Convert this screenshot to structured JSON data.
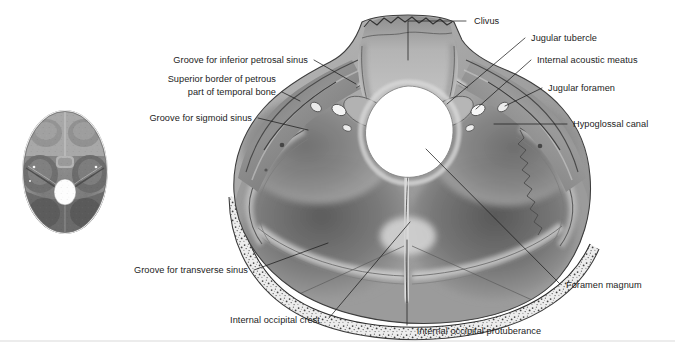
{
  "figure": {
    "background_color": "#ffffff",
    "text_color": "#1c1c1c",
    "leader_color": "#1d1d1d",
    "separator_color": "#d9d9d9"
  },
  "inset": {
    "name": "orientation-inset-skull-base",
    "description": "Small grayscale superior view of the interior of the cranial base showing anterior, middle and posterior cranial fossae with the foramen magnum"
  },
  "main_illustration": {
    "name": "posterior-cranial-fossa",
    "description": "Shaded grayscale drawing of the posterior cranial fossa seen from above, with the clivus anteriorly, the foramen magnum centrally, petrous ridges laterally and the cut diploic bone margin posteriorly"
  },
  "labels": [
    {
      "id": "clivus",
      "text": "Clivus",
      "align": "start",
      "x": 474,
      "y": 24,
      "leader": "M 466 21 L 408 21 L 408 60"
    },
    {
      "id": "jugular-tubercle",
      "text": "Jugular tubercle",
      "align": "start",
      "x": 531,
      "y": 41,
      "leader": "M 525 38 L 447 104"
    },
    {
      "id": "internal-acoustic-meatus",
      "text": "Internal acoustic meatus",
      "align": "start",
      "x": 537,
      "y": 63,
      "leader": "M 531 60 L 476 109"
    },
    {
      "id": "jugular-foramen",
      "text": "Jugular foramen",
      "align": "start",
      "x": 548,
      "y": 91,
      "leader": "M 542 88 L 505 106"
    },
    {
      "id": "hypoglossal-canal",
      "text": "Hypoglossal canal",
      "align": "start",
      "x": 573,
      "y": 127,
      "leader": "M 567 124 L 494 124"
    },
    {
      "id": "groove-for-inferior-petrosal-sinus",
      "text": "Groove for inferior petrosal sinus",
      "align": "end",
      "x": 308,
      "y": 63,
      "leader": "M 314 60 L 356 84"
    },
    {
      "id": "superior-border-of-petrous-part-of-temporal-bone-line1",
      "text": "Superior border of petrous",
      "align": "end",
      "x": 276,
      "y": 82,
      "leader": ""
    },
    {
      "id": "superior-border-of-petrous-part-of-temporal-bone-line2",
      "text": "part of temporal bone",
      "align": "end",
      "x": 276,
      "y": 95,
      "leader": "M 282 92 L 300 101"
    },
    {
      "id": "groove-for-sigmoid-sinus",
      "text": "Groove for sigmoid sinus",
      "align": "end",
      "x": 252,
      "y": 121,
      "leader": "M 258 118 L 308 130"
    },
    {
      "id": "groove-for-transverse-sinus",
      "text": "Groove for transverse sinus",
      "align": "end",
      "x": 248,
      "y": 273,
      "leader": "M 254 270 L 328 243"
    },
    {
      "id": "internal-occipital-crest",
      "text": "Internal occipital crest",
      "align": "middle",
      "x": 275,
      "y": 323,
      "leader": "M 329 318 L 410 222"
    },
    {
      "id": "internal-occipital-protuberance",
      "text": "Internal occipital protuberance",
      "align": "middle",
      "x": 479,
      "y": 334,
      "leader": "M 407 325 L 407 240"
    },
    {
      "id": "foramen-magnum",
      "text": "Foramen magnum",
      "align": "start",
      "x": 566,
      "y": 288,
      "leader": "M 560 284 L 426 149"
    }
  ]
}
